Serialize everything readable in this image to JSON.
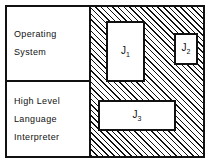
{
  "diagram": {
    "type": "memory-allocation-map",
    "frame": {
      "border_color": "#111111",
      "background_color": "#ffffff"
    },
    "system_panels": [
      {
        "name": "operating-system",
        "lines": [
          "Operating",
          "System"
        ]
      },
      {
        "name": "high-level-language-interpreter",
        "lines": [
          "High Level",
          "Language",
          "Interpreter"
        ]
      }
    ],
    "memory_region": {
      "name": "hatched-memory-region",
      "fill": "diagonal-hatch-45deg",
      "hatch_color": "#111111",
      "background_color": "#ffffff"
    },
    "jobs": [
      {
        "name": "job-1",
        "base_label": "J",
        "subscript": "1"
      },
      {
        "name": "job-2",
        "base_label": "J",
        "subscript": "2"
      },
      {
        "name": "job-3",
        "base_label": "J",
        "subscript": "3"
      }
    ]
  }
}
